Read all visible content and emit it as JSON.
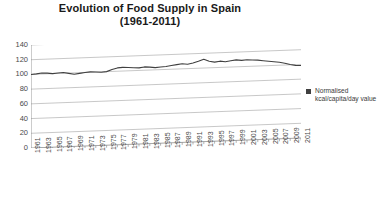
{
  "chart_data": {
    "type": "line",
    "title": "Evolution of Food Supply in Spain",
    "subtitle": "(1961-2011)",
    "title_line1": "Evolution of Food Supply in Spain",
    "title_line2": "(1961-2011)",
    "xlabel": "",
    "ylabel": "",
    "ylim": [
      0,
      140
    ],
    "yticks": [
      0,
      20,
      40,
      60,
      80,
      100,
      120,
      140
    ],
    "grid": true,
    "legend_position": "right",
    "series": [
      {
        "name": "Normalised kcal/capita/day value",
        "color": "#404040",
        "values": [
          100.0,
          100.5,
          101.5,
          101.0,
          100.0,
          100.5,
          101.0,
          99.5,
          98.0,
          99.0,
          100.0,
          100.5,
          100.0,
          99.5,
          100.0,
          102.5,
          104.5,
          105.0,
          104.5,
          104.0,
          103.5,
          104.5,
          104.0,
          103.0,
          103.5,
          104.0,
          105.0,
          106.0,
          107.0,
          106.0,
          107.5,
          109.5,
          112.0,
          109.0,
          107.5,
          108.5,
          107.5,
          108.5,
          109.5,
          108.5,
          109.0,
          108.5,
          108.0,
          107.0,
          106.0,
          105.0,
          104.0,
          102.5,
          100.5,
          99.0,
          98.5
        ]
      }
    ],
    "categories": [
      "1961",
      "1962",
      "1963",
      "1964",
      "1965",
      "1966",
      "1967",
      "1968",
      "1969",
      "1970",
      "1971",
      "1972",
      "1973",
      "1974",
      "1975",
      "1976",
      "1977",
      "1978",
      "1979",
      "1980",
      "1981",
      "1982",
      "1983",
      "1984",
      "1985",
      "1986",
      "1987",
      "1988",
      "1989",
      "1990",
      "1991",
      "1992",
      "1993",
      "1994",
      "1995",
      "1996",
      "1997",
      "1998",
      "1999",
      "2000",
      "2001",
      "2002",
      "2003",
      "2004",
      "2005",
      "2006",
      "2007",
      "2008",
      "2009",
      "2010",
      "2011"
    ],
    "xtick_labels": [
      "1961",
      "1963",
      "1965",
      "1967",
      "1969",
      "1971",
      "1973",
      "1975",
      "1977",
      "1979",
      "1981",
      "1983",
      "1985",
      "1987",
      "1989",
      "1991",
      "1993",
      "1995",
      "1997",
      "1999",
      "2001",
      "2003",
      "2005",
      "2007",
      "2009",
      "2011"
    ]
  },
  "legend": {
    "entry_label": "Normalised kcal/capita/day value",
    "swatch_color": "#404040"
  },
  "colors": {
    "background": "#ffffff",
    "gridline": "#b0b0b0",
    "axis": "#808080",
    "series": "#404040",
    "text": "#3a3a3a",
    "title": "#1a1a1a"
  }
}
